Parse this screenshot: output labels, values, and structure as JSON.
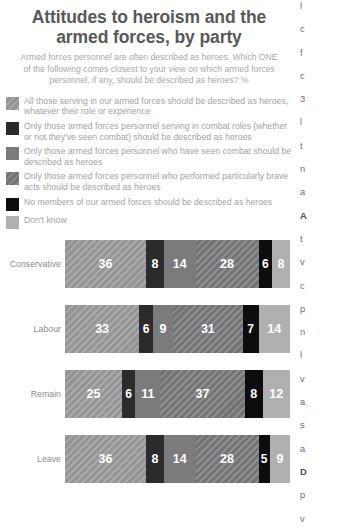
{
  "header": {
    "title": "Attitudes to heroism and the armed forces, by party",
    "subtitle": "Armed forces personnel are often described as heroes. Which ONE of the following comes closest to your view on which armed forces personnel, if any, should be described as heroes? %"
  },
  "legend": {
    "items": [
      {
        "label": "All those serving in our armed forces should be described as heroes, whatever their role or experience",
        "swatch": "hatch-light",
        "color": "#9d9d9f"
      },
      {
        "label": "Only those armed forces personnel serving in combat roles (whether or not they've seen combat) should be described as heroes",
        "swatch": "darkest",
        "color": "#2b2b2d"
      },
      {
        "label": "Only those armed forces personnel who have seen combat should be described as heroes",
        "swatch": "mid",
        "color": "#7b7b7e"
      },
      {
        "label": "Only those armed forces personnel who performed particularly brave acts should be described as heroes",
        "swatch": "hatch-mid",
        "color": "#7b7b7e"
      },
      {
        "label": "No members of our armed forces should be described as heroes",
        "swatch": "black",
        "color": "#0d0d0f"
      },
      {
        "label": "Don't know",
        "swatch": "paleblue",
        "color": "#b0b0b3"
      }
    ]
  },
  "chart_data": {
    "type": "bar",
    "orientation": "horizontal",
    "stacked": true,
    "title": "Attitudes to heroism and the armed forces, by party",
    "subtitle": "Armed forces personnel are often described as heroes. Which ONE of the following comes closest to your view on which armed forces personnel, if any, should be described as heroes? %",
    "xlabel": "",
    "ylabel": "",
    "xlim": [
      0,
      100
    ],
    "grid": false,
    "legend_position": "top",
    "categories": [
      "Conservative",
      "Labour",
      "Remain",
      "Leave"
    ],
    "series": [
      {
        "name": "All those serving in our armed forces should be described as heroes, whatever their role or experience",
        "color": "#9d9d9f",
        "swatch": "hatch-light",
        "values": [
          36,
          33,
          25,
          36
        ]
      },
      {
        "name": "Only those armed forces personnel serving in combat roles (whether or not they've seen combat) should be described as heroes",
        "color": "#2b2b2d",
        "swatch": "darkest",
        "values": [
          8,
          6,
          6,
          8
        ]
      },
      {
        "name": "Only those armed forces personnel who have seen combat should be described as heroes",
        "color": "#7b7b7e",
        "swatch": "mid",
        "values": [
          14,
          9,
          11,
          14
        ]
      },
      {
        "name": "Only those armed forces personnel who performed particularly brave acts should be described as heroes",
        "color": "#7b7b7e",
        "swatch": "hatch-mid",
        "values": [
          28,
          31,
          37,
          28
        ]
      },
      {
        "name": "No members of our armed forces should be described as heroes",
        "color": "#0d0d0f",
        "swatch": "black",
        "values": [
          6,
          7,
          8,
          5
        ]
      },
      {
        "name": "Don't know",
        "color": "#b0b0b3",
        "swatch": "paleblue",
        "values": [
          8,
          14,
          12,
          9
        ]
      }
    ]
  },
  "right_column": {
    "lines": [
      "l",
      "c",
      "f",
      "c",
      "3",
      "l",
      "t",
      "n",
      "a",
      "A",
      "t",
      "v",
      "c",
      "p",
      "n",
      "l",
      "v",
      "a",
      "s",
      "a",
      "D",
      "p",
      "v",
      "r",
      "a"
    ]
  }
}
